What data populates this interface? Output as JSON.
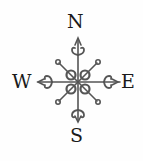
{
  "compass": {
    "north": "N",
    "south": "S",
    "east": "E",
    "west": "W",
    "ink_color": "#555555"
  }
}
